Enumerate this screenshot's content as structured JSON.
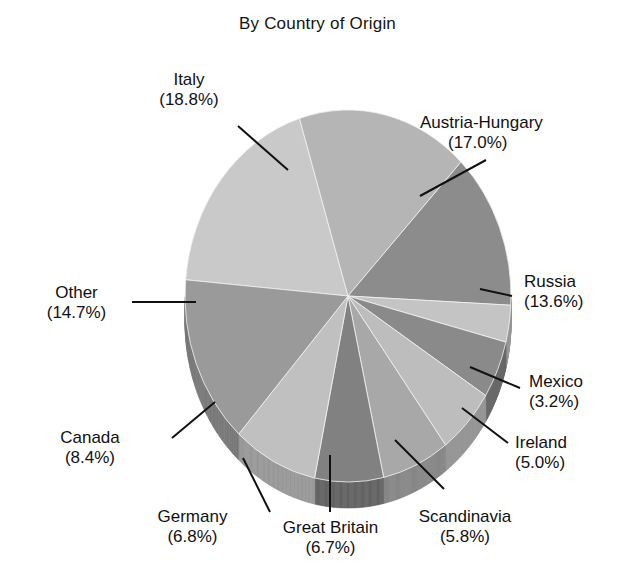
{
  "chart_data": {
    "type": "pie",
    "title": "By Country of Origin",
    "xlabel": "",
    "ylabel": "",
    "legend_position": "none",
    "grid": false,
    "value_unit": "%",
    "categories": [
      "Italy",
      "Austria-Hungary",
      "Russia",
      "Mexico",
      "Ireland",
      "Scandinavia",
      "Great Britain",
      "Germany",
      "Canada",
      "Other"
    ],
    "values": [
      18.8,
      17.0,
      13.6,
      3.2,
      5.0,
      5.8,
      6.7,
      6.8,
      8.4,
      14.7
    ],
    "slices": [
      {
        "label": "Italy",
        "value": 18.8,
        "pct_text": "(18.8%)",
        "color": "#c9c9c9",
        "side_color": "#a3a3a3"
      },
      {
        "label": "Austria-Hungary",
        "value": 17.0,
        "pct_text": "(17.0%)",
        "color": "#b5b5b5",
        "side_color": "#8f8f8f"
      },
      {
        "label": "Russia",
        "value": 13.6,
        "pct_text": "(13.6%)",
        "color": "#8c8c8c",
        "side_color": "#6d6d6d"
      },
      {
        "label": "Mexico",
        "value": 3.2,
        "pct_text": "(3.2%)",
        "color": "#c4c4c4",
        "side_color": "#9c9c9c"
      },
      {
        "label": "Ireland",
        "value": 5.0,
        "pct_text": "(5.0%)",
        "color": "#8a8a8a",
        "side_color": "#6a6a6a"
      },
      {
        "label": "Scandinavia",
        "value": 5.8,
        "pct_text": "(5.8%)",
        "color": "#bdbdbd",
        "side_color": "#959595"
      },
      {
        "label": "Great Britain",
        "value": 6.7,
        "pct_text": "(6.7%)",
        "color": "#a8a8a8",
        "side_color": "#868686"
      },
      {
        "label": "Germany",
        "value": 6.8,
        "pct_text": "(6.8%)",
        "color": "#818181",
        "side_color": "#636363"
      },
      {
        "label": "Canada",
        "value": 8.4,
        "pct_text": "(8.4%)",
        "color": "#c0c0c0",
        "side_color": "#989898"
      },
      {
        "label": "Other",
        "value": 14.7,
        "pct_text": "(14.7%)",
        "color": "#9a9a9a",
        "side_color": "#787878"
      }
    ]
  },
  "labels": [
    {
      "name": "Italy",
      "pct": "(18.8%)"
    },
    {
      "name": "Austria-Hungary",
      "pct": "(17.0%)"
    },
    {
      "name": "Russia",
      "pct": "(13.6%)"
    },
    {
      "name": "Mexico",
      "pct": "(3.2%)"
    },
    {
      "name": "Ireland",
      "pct": "(5.0%)"
    },
    {
      "name": "Scandinavia",
      "pct": "(5.8%)"
    },
    {
      "name": "Great Britain",
      "pct": "(6.7%)"
    },
    {
      "name": "Germany",
      "pct": "(6.8%)"
    },
    {
      "name": "Canada",
      "pct": "(8.4%)"
    },
    {
      "name": "Other",
      "pct": "(14.7%)"
    }
  ]
}
